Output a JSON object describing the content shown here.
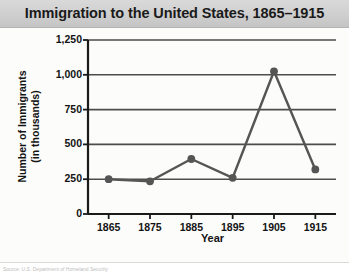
{
  "chart_title": "Immigration to the United States, 1865–1915",
  "caption": "Source: U.S. Department of Homeland Security",
  "colors": {
    "title_bar": "#cfcfcf",
    "plot_background": "#fcfcfa",
    "line": "#555555",
    "marker": "#555555",
    "gridline": "#4d4d4d",
    "axis": "#1a1a1a",
    "text": "#131313"
  },
  "chart_data": {
    "type": "line",
    "title": "Immigration to the United States, 1865–1915",
    "xlabel": "Year",
    "ylabel": "Number of Immigrants (in thousands)",
    "x": [
      1865,
      1875,
      1885,
      1895,
      1905,
      1915
    ],
    "values": [
      250,
      235,
      395,
      260,
      1025,
      320
    ],
    "xtick_labels": [
      "1865",
      "1875",
      "1885",
      "1895",
      "1905",
      "1915"
    ],
    "ytick_labels": [
      "0",
      "250",
      "500",
      "750",
      "1,000",
      "1,250"
    ],
    "ytick_values": [
      0,
      250,
      500,
      750,
      1000,
      1250
    ],
    "xlim": [
      1860,
      1920
    ],
    "ylim": [
      0,
      1250
    ],
    "grid": "horizontal",
    "legend": "none",
    "marker": "circle",
    "series": [
      {
        "name": "Number of Immigrants (in thousands)",
        "values": [
          250,
          235,
          395,
          260,
          1025,
          320
        ]
      }
    ]
  }
}
